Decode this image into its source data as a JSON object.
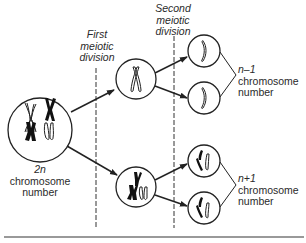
{
  "diagram": {
    "stages": {
      "first_division": {
        "line1": "First",
        "line2": "meiotic",
        "line3": "division"
      },
      "second_division": {
        "line1": "Second",
        "line2": "meiotic",
        "line3": "division"
      }
    },
    "parent_cell": {
      "ploidy": "2n",
      "line2": "chromosome",
      "line3": "number"
    },
    "gamete_groups": [
      {
        "ploidy": "n–1",
        "line2": "chromosome",
        "line3": "number"
      },
      {
        "ploidy": "n+1",
        "line2": "chromosome",
        "line3": "number"
      }
    ],
    "colors": {
      "stroke": "#2a2a2a",
      "background": "#ffffff",
      "rule": "#777777"
    }
  }
}
